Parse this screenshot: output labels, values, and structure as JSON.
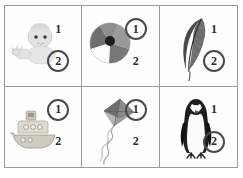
{
  "worksheet": {
    "title": "Picture multiple-choice worksheet",
    "columns": 3,
    "rows": 2,
    "border_color": "#9a9a9a",
    "background_color": "#fefefe",
    "text_color": "#2b2b2b",
    "circle_color": "#4a4a4a",
    "cells": [
      {
        "id": "cell-1",
        "picture": "baby-icon",
        "picture_label": "baby",
        "options": [
          {
            "label": "1",
            "selected": false
          },
          {
            "label": "2",
            "selected": true
          }
        ]
      },
      {
        "id": "cell-2",
        "picture": "beach-ball-icon",
        "picture_label": "beach ball",
        "options": [
          {
            "label": "1",
            "selected": true
          },
          {
            "label": "2",
            "selected": false
          }
        ]
      },
      {
        "id": "cell-3",
        "picture": "feather-icon",
        "picture_label": "feather",
        "options": [
          {
            "label": "1",
            "selected": false
          },
          {
            "label": "2",
            "selected": true
          }
        ]
      },
      {
        "id": "cell-4",
        "picture": "tugboat-icon",
        "picture_label": "tugboat",
        "options": [
          {
            "label": "1",
            "selected": true
          },
          {
            "label": "2",
            "selected": false
          }
        ]
      },
      {
        "id": "cell-5",
        "picture": "kite-icon",
        "picture_label": "kite",
        "options": [
          {
            "label": "1",
            "selected": true
          },
          {
            "label": "2",
            "selected": false
          }
        ]
      },
      {
        "id": "cell-6",
        "picture": "penguin-icon",
        "picture_label": "penguin",
        "options": [
          {
            "label": "1",
            "selected": false
          },
          {
            "label": "2",
            "selected": true
          }
        ]
      }
    ]
  }
}
